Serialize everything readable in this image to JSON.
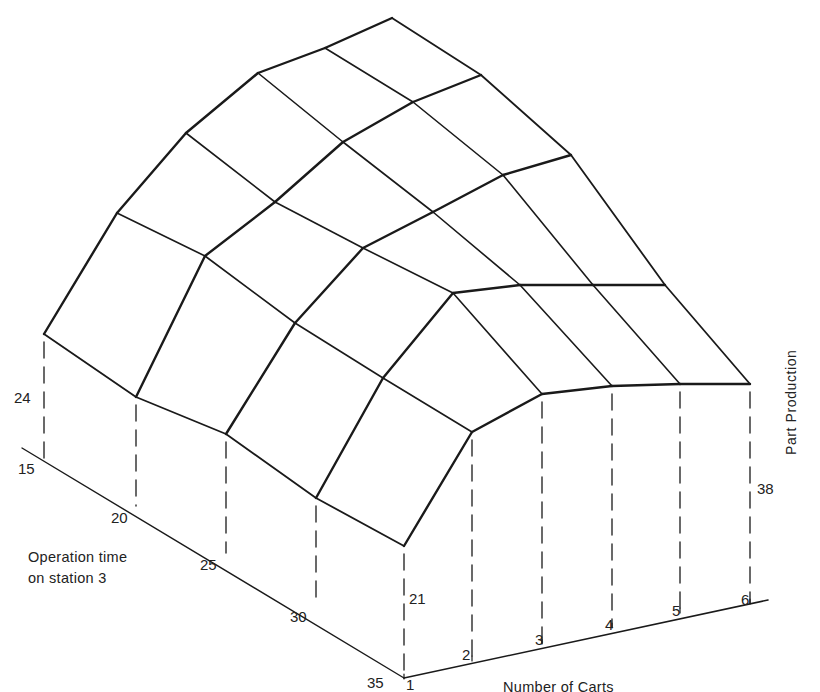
{
  "chart_data": {
    "type": "surface-3d-wireframe",
    "title": "",
    "xlabel": "Number of Carts",
    "ylabel_depth": "Operation time on station 3",
    "zlabel": "Part Production",
    "x_ticks": [
      "1",
      "2",
      "3",
      "4",
      "5",
      "6"
    ],
    "depth_ticks": [
      "15",
      "20",
      "25",
      "30",
      "35"
    ],
    "annotated_values": [
      {
        "label": "24",
        "carts": 1,
        "operation_time": 15
      },
      {
        "label": "21",
        "carts": 1,
        "operation_time": 35
      },
      {
        "label": "38",
        "carts": 6,
        "operation_time": 35
      }
    ],
    "grid_shape": [
      5,
      6
    ],
    "screen_vertices": {
      "op15": [
        [
          44,
          334
        ],
        [
          117,
          213
        ],
        [
          186,
          133
        ],
        [
          258,
          73
        ],
        [
          325,
          48
        ],
        [
          392,
          18
        ]
      ],
      "op20": [
        [
          136,
          397
        ],
        [
          205,
          256
        ],
        [
          275,
          202
        ],
        [
          343,
          142
        ],
        [
          413,
          102
        ],
        [
          481,
          75
        ]
      ],
      "op25": [
        [
          226,
          434
        ],
        [
          295,
          323
        ],
        [
          363,
          248
        ],
        [
          433,
          212
        ],
        [
          503,
          175
        ],
        [
          571,
          155
        ]
      ],
      "op30": [
        [
          316,
          498
        ],
        [
          383,
          378
        ],
        [
          453,
          293
        ],
        [
          520,
          285
        ],
        [
          593,
          285
        ],
        [
          665,
          285
        ]
      ],
      "op35": [
        [
          404,
          546
        ],
        [
          472,
          432
        ],
        [
          542,
          394
        ],
        [
          612,
          386
        ],
        [
          680,
          384
        ],
        [
          750,
          384
        ]
      ]
    },
    "floor": {
      "op_axis": [
        [
          22,
          448
        ],
        [
          404,
          678
        ]
      ],
      "cart_axis": [
        [
          404,
          678
        ],
        [
          768,
          600
        ]
      ],
      "op_ticks": [
        [
          44,
          459
        ],
        [
          136,
          506
        ],
        [
          226,
          553
        ],
        [
          316,
          602
        ],
        [
          404,
          678
        ]
      ],
      "cart_ticks": [
        [
          404,
          678
        ],
        [
          472,
          660
        ],
        [
          542,
          643
        ],
        [
          612,
          627
        ],
        [
          680,
          612
        ],
        [
          750,
          603
        ]
      ]
    },
    "legend": null,
    "grid": false
  },
  "labels": {
    "depth_axis_line1": "Operation time",
    "depth_axis_line2": "on station 3",
    "x_axis_title": "Number of Carts",
    "z_axis_title": "Part Production",
    "value_24": "24",
    "value_21": "21",
    "value_38": "38",
    "op_ticks": [
      "15",
      "20",
      "25",
      "30",
      "35"
    ],
    "cart_ticks": [
      "1",
      "2",
      "3",
      "4",
      "5",
      "6"
    ]
  },
  "colors": {
    "ink": "#1a1a1a",
    "background": "#ffffff"
  }
}
